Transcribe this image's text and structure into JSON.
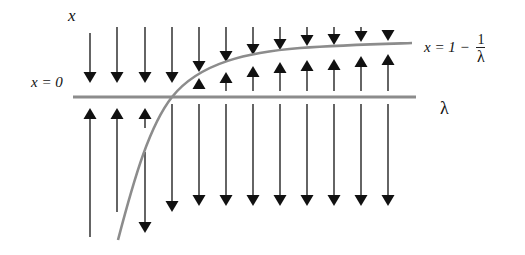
{
  "labels": {
    "x_axis": "x",
    "x_zero": "x = 0",
    "lambda_axis": "λ",
    "curve_lhs": "x = 1 − ",
    "curve_num": "1",
    "curve_den": "λ"
  },
  "colors": {
    "arrow": "#111111",
    "axis": "#8c8c8c",
    "curve": "#8c8c8c",
    "text": "#111111"
  },
  "axis": {
    "x1": 73,
    "x2": 416,
    "y": 97
  },
  "curve_path": "M118,240 C135,175 150,125 172,97 C200,62 250,52 300,48 C340,45 380,44 412,43",
  "columns": [
    {
      "x": 90,
      "top_down": [
        33,
        83
      ],
      "bottom_up": [
        237,
        108
      ]
    },
    {
      "x": 117,
      "top_down": [
        27,
        83
      ],
      "bottom_up": [
        212,
        108
      ]
    },
    {
      "x": 145,
      "top_down": [
        27,
        83
      ],
      "bottom_up": [
        128,
        108
      ],
      "below_down": [
        152,
        233
      ]
    },
    {
      "x": 172,
      "top_down": [
        27,
        83
      ],
      "below_down": [
        104,
        212
      ]
    },
    {
      "x": 199,
      "top_down": [
        27,
        72
      ],
      "short_up": [
        88,
        78
      ],
      "below_down": [
        104,
        206
      ]
    },
    {
      "x": 226,
      "top_down": [
        27,
        62
      ],
      "short_up": [
        91,
        72
      ],
      "below_down": [
        104,
        206
      ]
    },
    {
      "x": 253,
      "top_down": [
        27,
        55
      ],
      "short_up": [
        91,
        66
      ],
      "below_down": [
        104,
        206
      ]
    },
    {
      "x": 280,
      "top_down": [
        27,
        50
      ],
      "short_up": [
        91,
        62
      ],
      "below_down": [
        104,
        206
      ]
    },
    {
      "x": 307,
      "top_down": [
        27,
        46
      ],
      "short_up": [
        91,
        60
      ],
      "below_down": [
        104,
        206
      ]
    },
    {
      "x": 334,
      "top_down": [
        27,
        45
      ],
      "short_up": [
        91,
        59
      ],
      "below_down": [
        104,
        206
      ]
    },
    {
      "x": 361,
      "top_down": [
        27,
        42
      ],
      "short_up": [
        91,
        56
      ],
      "below_down": [
        104,
        206
      ]
    },
    {
      "x": 388,
      "top_down": [
        31,
        41
      ],
      "short_up": [
        91,
        54
      ],
      "below_down": [
        104,
        206
      ]
    }
  ]
}
